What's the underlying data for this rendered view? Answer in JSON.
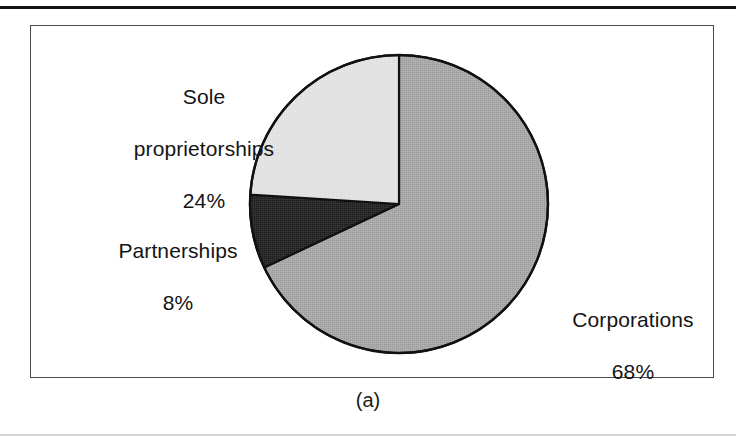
{
  "figure": {
    "caption": "(a)",
    "frame": {
      "border_color": "#4a4a4a"
    },
    "rules": {
      "top_color": "#121212",
      "bottom_color": "#d6d6d6"
    }
  },
  "chart_data": {
    "type": "pie",
    "title": "",
    "subtitle": "",
    "xlabel": "",
    "ylabel": "",
    "grid": false,
    "legend_position": "none",
    "labels_position": "outside",
    "start_angle_deg": 0,
    "direction": "clockwise",
    "units": "percent",
    "total": 100,
    "categories": [
      "Corporations",
      "Partnerships",
      "Sole proprietorships"
    ],
    "values": [
      68,
      8,
      24
    ],
    "slices": [
      {
        "name": "Corporations",
        "value": 68,
        "value_label": "68%",
        "color": "#a8a8a8",
        "stroke": "#111111",
        "start_deg": 0,
        "end_deg": 244.8,
        "label_text": "Corporations\n68%"
      },
      {
        "name": "Partnerships",
        "value": 8,
        "value_label": "8%",
        "color": "#2a2a2a",
        "stroke": "#111111",
        "start_deg": 244.8,
        "end_deg": 273.6,
        "label_text": "Partnerships\n8%"
      },
      {
        "name": "Sole proprietorships",
        "value": 24,
        "value_label": "24%",
        "color": "#e2e2e2",
        "stroke": "#111111",
        "start_deg": 273.6,
        "end_deg": 360,
        "label_text": "Sole proprietorships\n24%"
      }
    ],
    "annotations": [
      {
        "name": "sole-proprietorships",
        "line1": "Sole",
        "line2": "proprietorships",
        "line3": "24%"
      },
      {
        "name": "partnerships",
        "line1": "Partnerships",
        "line2": "8%"
      },
      {
        "name": "corporations",
        "line1": "Corporations",
        "line2": "68%"
      }
    ]
  },
  "labels": {
    "sole": {
      "name_line1": "Sole",
      "name_line2": "proprietorships",
      "pct": "24%"
    },
    "partnerships": {
      "name": "Partnerships",
      "pct": "8%"
    },
    "corporations": {
      "name": "Corporations",
      "pct": "68%"
    }
  }
}
